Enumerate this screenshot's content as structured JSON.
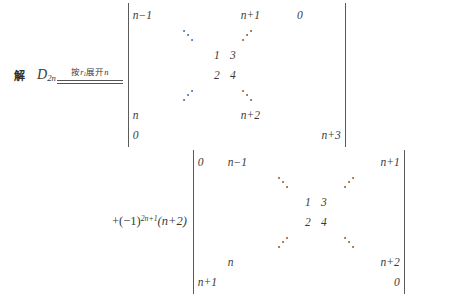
{
  "problem": {
    "solution_label": "解",
    "determinant_name": "D",
    "determinant_subscript": "2n",
    "annotation": {
      "prefix": "按",
      "row_symbol": "r",
      "row_subscript": "1",
      "middle": "展开",
      "suffix": "n"
    }
  },
  "step2": {
    "coefficient": "+(−1)",
    "coefficient_exponent": "2n+1",
    "coefficient_factor": "(n+2)"
  },
  "determinant1": {
    "rows": [
      [
        "n−1",
        "",
        "",
        "",
        "n+1",
        "0",
        ""
      ],
      [
        "",
        "⋱",
        "",
        "",
        "⋰",
        "",
        ""
      ],
      [
        "",
        "",
        "1",
        "3",
        "",
        "",
        ""
      ],
      [
        "",
        "",
        "2",
        "4",
        "",
        "",
        ""
      ],
      [
        "",
        "⋰",
        "",
        "",
        "⋱",
        "",
        ""
      ],
      [
        "n",
        "",
        "",
        "",
        "n+2",
        "",
        ""
      ],
      [
        "0",
        "",
        "",
        "",
        "",
        "",
        "n+3"
      ]
    ]
  },
  "determinant2": {
    "rows": [
      [
        "0",
        "n−1",
        "",
        "",
        "",
        "",
        "n+1"
      ],
      [
        "",
        "",
        "⋱",
        "",
        "",
        "⋰",
        ""
      ],
      [
        "",
        "",
        "",
        "1",
        "3",
        "",
        ""
      ],
      [
        "",
        "",
        "",
        "2",
        "4",
        "",
        ""
      ],
      [
        "",
        "",
        "⋰",
        "",
        "",
        "⋱",
        ""
      ],
      [
        "",
        "n",
        "",
        "",
        "",
        "",
        "n+2"
      ],
      [
        "n+1",
        "",
        "",
        "",
        "",
        "",
        "0"
      ]
    ]
  }
}
